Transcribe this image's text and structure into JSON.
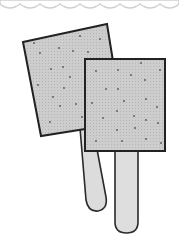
{
  "illustration": {
    "subject": "Two popsicles (ice pops on sticks)",
    "colors": {
      "background": "#ffffff",
      "pop_fill": "#c8c8c8",
      "stick_fill": "#dedede",
      "outline": "#2a2a2a",
      "speckle": "#555555",
      "scallop": "#cfcfcf"
    },
    "items": [
      {
        "name": "back-popsicle",
        "rotation_deg": -12
      },
      {
        "name": "front-popsicle",
        "rotation_deg": 0
      }
    ]
  }
}
